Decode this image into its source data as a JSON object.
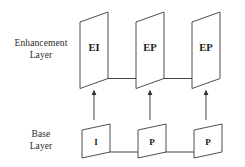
{
  "diagram": {
    "background_color": "#ffffff",
    "line_color": "#2f2f2f",
    "text_color": "#1a1a1a",
    "layers": [
      {
        "id": "enhancement",
        "label_line1": "Enhancement",
        "label_line2": "Layer",
        "frames": [
          {
            "label": "EI"
          },
          {
            "label": "EP"
          },
          {
            "label": "EP"
          }
        ]
      },
      {
        "id": "base",
        "label_line1": "Base",
        "label_line2": "Layer",
        "frames": [
          {
            "label": "I"
          },
          {
            "label": "P"
          },
          {
            "label": "P"
          }
        ]
      }
    ],
    "connections": {
      "enhancement_horizontal_count": 2,
      "base_horizontal_count": 2,
      "vertical_up_count": 3,
      "vertical_direction": "up",
      "horizontal_direction": "right"
    }
  }
}
